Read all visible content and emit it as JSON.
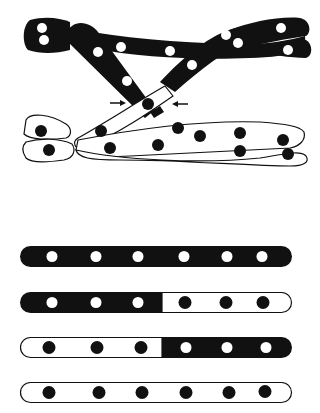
{
  "figure": {
    "colors": {
      "paternal": "#111111",
      "maternal": "#ffffff",
      "outline": "#111111",
      "background": "#ffffff"
    },
    "chiasma_arrows": 2,
    "top_pair": {
      "color": "dark",
      "strands": 2
    },
    "bottom_pair": {
      "color": "light",
      "strands": 2
    }
  },
  "chromatids": [
    {
      "label": "parental-dark",
      "left_segment": "dark",
      "right_segment": "dark",
      "markers": 6
    },
    {
      "label": "recombinant-dark-light",
      "left_segment": "dark",
      "right_segment": "light",
      "markers": 6
    },
    {
      "label": "recombinant-light-dark",
      "left_segment": "light",
      "right_segment": "dark",
      "markers": 6
    },
    {
      "label": "parental-light",
      "left_segment": "light",
      "right_segment": "light",
      "markers": 6
    }
  ]
}
